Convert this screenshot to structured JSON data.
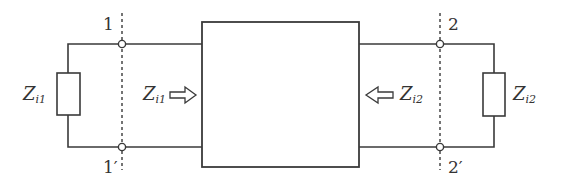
{
  "diagram": {
    "type": "two-port network with image impedances",
    "colors": {
      "line": "#3a3a3a",
      "text": "#333333",
      "background": "#ffffff"
    },
    "terminals": {
      "port1_top": "1",
      "port1_bottom": "1′",
      "port2_top": "2",
      "port2_bottom": "2′"
    },
    "labels": {
      "left_load": {
        "main": "Z",
        "sub": "i1"
      },
      "left_input": {
        "main": "Z",
        "sub": "i1"
      },
      "right_input": {
        "main": "Z",
        "sub": "i2"
      },
      "right_load": {
        "main": "Z",
        "sub": "i2"
      }
    },
    "arrows": {
      "left": "right-pointing hollow arrow",
      "right": "left-pointing hollow arrow"
    }
  }
}
